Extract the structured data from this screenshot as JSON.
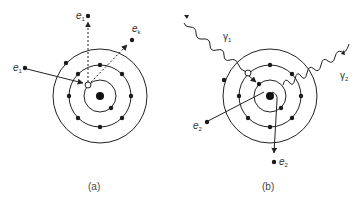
{
  "figure": {
    "panels": [
      {
        "id": "a",
        "caption": "(a)",
        "description": "Incident electron e1 ejects an inner-shell electron ek, creating a vacancy; scattered electron e1 leaves",
        "labels": {
          "incident_electron": {
            "base": "e",
            "sub": "1"
          },
          "scattered_electron": {
            "base": "e",
            "sub": "1"
          },
          "ejected_electron": {
            "base": "e",
            "sub": "k"
          }
        }
      },
      {
        "id": "b",
        "caption": "(b)",
        "description": "Photon γ1 ejects an electron; an outer electron fills the vacancy emitting photon γ2; electrons e2 shown",
        "labels": {
          "incident_photon": {
            "base": "γ",
            "sub": "1"
          },
          "emitted_photon": {
            "base": "γ",
            "sub": "2"
          },
          "electron_left": {
            "base": "e",
            "sub": "2"
          },
          "electron_bottom": {
            "base": "e",
            "sub": "2"
          }
        }
      }
    ],
    "colors": {
      "line": "#222222",
      "dot": "#1a1a1a",
      "vacancy_fill": "#ffffff",
      "caption": "#444444"
    }
  }
}
